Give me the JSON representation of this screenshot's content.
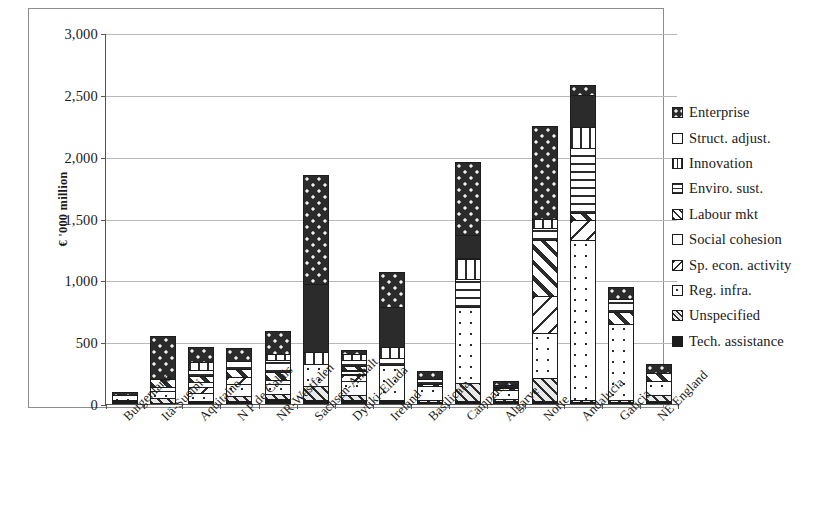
{
  "chart_data": {
    "type": "bar",
    "subtype": "stacked-vertical",
    "title": "",
    "xlabel": "",
    "ylabel": "€ '000 million",
    "ylim": [
      0,
      3000
    ],
    "yticks": [
      0,
      500,
      1000,
      1500,
      2000,
      2500,
      3000
    ],
    "ytick_labels": [
      "0",
      "500",
      "1,000",
      "1,500",
      "2,000",
      "2,500",
      "3,000"
    ],
    "grid": true,
    "grid_axis": "y",
    "legend_position": "right",
    "categories": [
      "Burgenland",
      "Itä-Suomi",
      "Aquitaine",
      "N P de Calais",
      "NR-Westfalen",
      "Sachsen-Anhalt",
      "Dytiki-Ellada",
      "Ireland",
      "Basilicata",
      "Campania",
      "Algarve",
      "Norte",
      "Andalucia",
      "Galicia",
      "NE England"
    ],
    "series": [
      {
        "name": "Enterprise",
        "key": "enterprise",
        "pattern": "p-enterprise",
        "values": [
          35,
          350,
          130,
          110,
          195,
          890,
          40,
          295,
          70,
          600,
          40,
          760,
          95,
          110,
          80
        ]
      },
      {
        "name": "Struct. adjust.",
        "key": "struct",
        "pattern": "p-struct",
        "values": [
          0,
          0,
          0,
          0,
          0,
          560,
          0,
          330,
          0,
          195,
          0,
          0,
          260,
          0,
          0
        ]
      },
      {
        "name": "Innovation",
        "key": "innovation",
        "pattern": "p-innovation",
        "values": [
          0,
          0,
          70,
          0,
          55,
          100,
          55,
          95,
          0,
          175,
          0,
          80,
          180,
          0,
          0
        ]
      },
      {
        "name": "Enviro. sust.",
        "key": "enviro",
        "pattern": "p-enviro",
        "values": [
          0,
          0,
          55,
          70,
          105,
          0,
          55,
          60,
          45,
          235,
          30,
          105,
          530,
          110,
          0
        ]
      },
      {
        "name": "Labour mkt",
        "key": "labour",
        "pattern": "p-labour",
        "values": [
          0,
          70,
          55,
          75,
          70,
          0,
          45,
          0,
          30,
          0,
          25,
          460,
          70,
          105,
          70
        ]
      },
      {
        "name": "Social cohesion",
        "key": "social",
        "pattern": "p-social",
        "values": [
          0,
          40,
          50,
          0,
          40,
          0,
          40,
          0,
          0,
          0,
          0,
          0,
          0,
          0,
          0
        ]
      },
      {
        "name": "Sp. econ. activity",
        "key": "spec",
        "pattern": "p-spec",
        "values": [
          0,
          0,
          55,
          65,
          0,
          0,
          60,
          0,
          0,
          0,
          0,
          310,
          165,
          0,
          0
        ]
      },
      {
        "name": "Reg. infra.",
        "key": "reginfra",
        "pattern": "p-reginfra",
        "values": [
          50,
          70,
          75,
          105,
          85,
          190,
          120,
          290,
          115,
          620,
          85,
          370,
          1300,
          620,
          120
        ]
      },
      {
        "name": "Unspecified",
        "key": "unspec",
        "pattern": "p-unspec",
        "values": [
          0,
          45,
          0,
          45,
          50,
          120,
          50,
          0,
          25,
          150,
          20,
          195,
          25,
          25,
          55
        ]
      },
      {
        "name": "Tech. assistance",
        "key": "tech",
        "pattern": "p-tech",
        "values": [
          30,
          0,
          20,
          25,
          40,
          30,
          30,
          35,
          15,
          25,
          25,
          20,
          10,
          10,
          25
        ]
      }
    ],
    "totals": [
      115,
      575,
      510,
      495,
      640,
      1890,
      495,
      1105,
      300,
      2000,
      225,
      2300,
      2635,
      980,
      350
    ]
  },
  "legend": {
    "items": [
      {
        "label": "Enterprise",
        "pattern": "p-enterprise"
      },
      {
        "label": "Struct. adjust.",
        "pattern": "p-struct"
      },
      {
        "label": "Innovation",
        "pattern": "p-innovation"
      },
      {
        "label": "Enviro. sust.",
        "pattern": "p-enviro"
      },
      {
        "label": "Labour mkt",
        "pattern": "p-labour"
      },
      {
        "label": "Social cohesion",
        "pattern": "p-social"
      },
      {
        "label": "Sp. econ. activity",
        "pattern": "p-spec"
      },
      {
        "label": "Reg. infra.",
        "pattern": "p-reginfra"
      },
      {
        "label": "Unspecified",
        "pattern": "p-unspec"
      },
      {
        "label": "Tech. assistance",
        "pattern": "p-tech"
      }
    ]
  },
  "colors": {
    "ink": "#1c1c1c",
    "grid": "#b9b9b9",
    "axis": "#555555",
    "background": "#ffffff"
  }
}
